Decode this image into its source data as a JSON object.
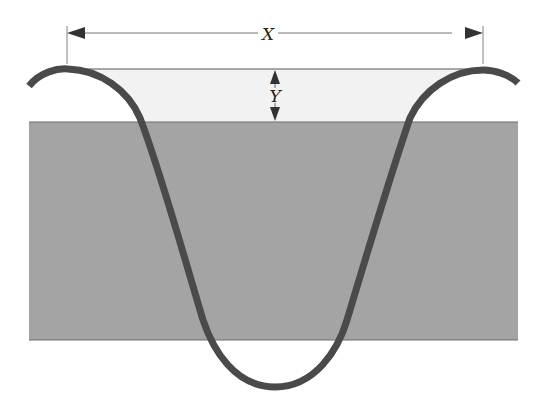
{
  "diagram": {
    "type": "cross-section",
    "labels": {
      "width_label": "X",
      "depth_label": "Y"
    },
    "colors": {
      "band_fill": "#a4a4a4",
      "band_edge": "#6e6e6e",
      "gap_fill": "#f2f2f2",
      "curve_stroke": "#4a4a4a",
      "dimension_line": "#555555"
    }
  }
}
